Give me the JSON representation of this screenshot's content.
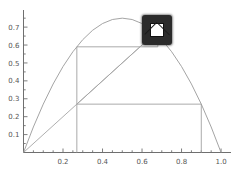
{
  "chart_data": {
    "type": "line",
    "title": "",
    "xlabel": "",
    "ylabel": "",
    "xlim": [
      0.0,
      1.02
    ],
    "ylim": [
      0.0,
      0.79
    ],
    "grid": false,
    "legend": "none",
    "x_ticks_major": [
      0.2,
      0.4,
      0.6,
      0.8,
      1.0
    ],
    "x_tick_labels": [
      "0.2",
      "0.4",
      "0.6",
      "0.8",
      "1.0"
    ],
    "x_ticks_minor": [
      0.05,
      0.1,
      0.15,
      0.25,
      0.3,
      0.35,
      0.45,
      0.5,
      0.55,
      0.65,
      0.7,
      0.75,
      0.85,
      0.9,
      0.95
    ],
    "y_ticks_major": [
      0.1,
      0.2,
      0.3,
      0.4,
      0.5,
      0.6,
      0.7
    ],
    "y_tick_labels": [
      "0.1",
      "0.2",
      "0.3",
      "0.4",
      "0.5",
      "0.6",
      "0.7"
    ],
    "y_ticks_minor": [
      0.05,
      0.15,
      0.25,
      0.35,
      0.45,
      0.55,
      0.65,
      0.75
    ],
    "series": [
      {
        "name": "parabola",
        "kind": "curve",
        "color": "#9a9a9a",
        "formula": "f(x) = 3x(1-x)",
        "peak": [
          0.5,
          0.75
        ],
        "points": [
          [
            0.0,
            0.0
          ],
          [
            0.05,
            0.1425
          ],
          [
            0.1,
            0.27
          ],
          [
            0.15,
            0.3825
          ],
          [
            0.2,
            0.48
          ],
          [
            0.25,
            0.5625
          ],
          [
            0.3,
            0.63
          ],
          [
            0.35,
            0.6825
          ],
          [
            0.4,
            0.72
          ],
          [
            0.45,
            0.7425
          ],
          [
            0.5,
            0.75
          ],
          [
            0.55,
            0.7425
          ],
          [
            0.6,
            0.72
          ],
          [
            0.65,
            0.6825
          ],
          [
            0.7,
            0.63
          ],
          [
            0.75,
            0.5625
          ],
          [
            0.8,
            0.48
          ],
          [
            0.85,
            0.3825
          ],
          [
            0.9,
            0.27
          ],
          [
            0.95,
            0.1425
          ],
          [
            1.0,
            0.0
          ]
        ]
      },
      {
        "name": "identity-diagonal",
        "kind": "line",
        "color": "#a6a6a6",
        "formula": "y = x",
        "points": [
          [
            0.0,
            0.0
          ],
          [
            0.68,
            0.68
          ]
        ]
      },
      {
        "name": "cobweb-path",
        "kind": "step",
        "color": "#a0a0a0",
        "points": [
          [
            0.27,
            0.0
          ],
          [
            0.27,
            0.59
          ],
          [
            0.68,
            0.59
          ],
          [
            0.68,
            0.68
          ],
          [
            0.27,
            0.27
          ],
          [
            0.9,
            0.27
          ],
          [
            0.9,
            0.0
          ]
        ]
      }
    ],
    "annotations": [
      {
        "name": "selection-handle",
        "kind": "marker",
        "shape": "x-in-box",
        "x": 0.675,
        "y": 0.685,
        "box_color": "#2b2b2b",
        "inner_color": "#ffffff",
        "glyph": "x"
      }
    ]
  },
  "axes": {
    "axis_color": "#6f6f6f",
    "tick_label_color": "#555555",
    "tick_label_size_px": 7
  },
  "icons": {
    "handle_icon_name": "x-marker-icon"
  }
}
